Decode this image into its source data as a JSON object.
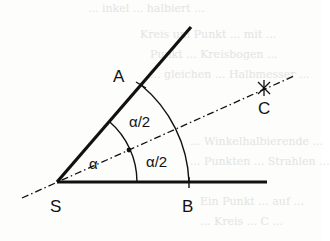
{
  "figure": {
    "points": {
      "S": {
        "label": "S",
        "x": 57,
        "y": 182
      },
      "A": {
        "label": "A",
        "x": 141,
        "y": 85
      },
      "B": {
        "label": "B",
        "x": 189,
        "y": 182
      },
      "C": {
        "label": "C",
        "x": 264,
        "y": 88
      }
    },
    "angle_labels": {
      "full": "α",
      "upper_half": "α/2",
      "lower_half": "α/2"
    },
    "colors": {
      "ink": "#111111",
      "paper": "#fdfdfc",
      "bleed_text": "#e4e4e2"
    }
  },
  "bleed_through_text": [
    "... inkel ... halbiert ...",
    "Kreis um Punkt ... mit ... ",
    "Punkt ... Kreisbogen ... ",
    "... gleichen ... Halbmesser ...",
    "... Winkelhalbierende ...",
    "... Punkten ... Strahlen ...",
    "Ein Punkt ... auf ... ",
    "... Kreis ... C ... "
  ]
}
